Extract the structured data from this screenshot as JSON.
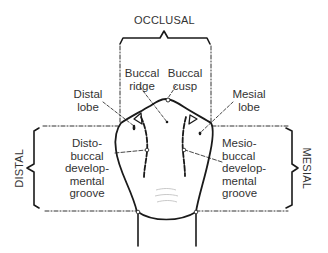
{
  "diagram": {
    "colors": {
      "line": "#1a1a1a",
      "text": "#333333",
      "background": "#ffffff"
    },
    "regions": {
      "occlusal": "OCCLUSAL",
      "distal": "DISTAL",
      "mesial": "MESIAL"
    },
    "labels": {
      "buccal_ridge": "Buccal\nridge",
      "buccal_cusp": "Buccal\ncusp",
      "distal_lobe": "Distal\nlobe",
      "mesial_lobe": "Mesial\nlobe",
      "distobuccal_groove": "Disto-\nbuccal\ndevelop-\nmental\ngroove",
      "mesiobuccal_groove": "Mesio-\nbuccal\ndevelop-\nmental\ngroove"
    }
  }
}
